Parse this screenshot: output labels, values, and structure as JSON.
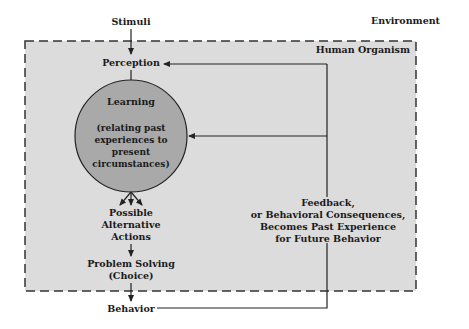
{
  "diagram": {
    "environment_label": "Environment",
    "organism_label": "Human Organism",
    "stimuli": "Stimuli",
    "perception": "Perception",
    "learning": {
      "title": "Learning",
      "lines": [
        "(relating past",
        "experiences to",
        "present",
        "circumstances)"
      ]
    },
    "alternatives": [
      "Possible",
      "Alternative",
      "Actions"
    ],
    "problem_solving": [
      "Problem Solving",
      "(Choice)"
    ],
    "behavior": "Behavior",
    "feedback": [
      "Feedback,",
      "or Behavioral Consequences,",
      "Becomes Past Experience",
      "for Future Behavior"
    ],
    "colors": {
      "organism_fill": "#dcdcdc",
      "learning_fill": "#a9a9a9",
      "line": "#222222"
    }
  }
}
